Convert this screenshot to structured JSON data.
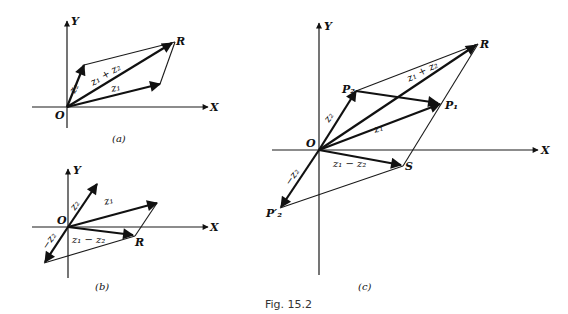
{
  "figure": {
    "caption": "Fig. 15.2",
    "panels": [
      {
        "id": "a",
        "caption": "(a)",
        "axis_labels": {
          "x": "X",
          "y": "Y",
          "origin": "O"
        },
        "points": {
          "R": "R"
        },
        "vectors": {
          "z1": "z₁",
          "z2": "z₂",
          "sum": "z₁ + z₂"
        }
      },
      {
        "id": "b",
        "caption": "(b)",
        "axis_labels": {
          "x": "X",
          "y": "Y",
          "origin": "O"
        },
        "points": {
          "R": "R"
        },
        "vectors": {
          "z1": "z₁",
          "z2": "z₂",
          "neg_z2": "−z₂",
          "diff": "z₁ − z₂"
        }
      },
      {
        "id": "c",
        "caption": "(c)",
        "axis_labels": {
          "x": "X",
          "y": "Y",
          "origin": "O"
        },
        "points": {
          "R": "R",
          "P1": "P₁",
          "P2": "P₂",
          "S": "S",
          "P2prime": "P′₂"
        },
        "vectors": {
          "z1": "z₁",
          "z2": "z₂",
          "neg_z2": "−z₂",
          "sum": "z₁ + z₂",
          "diff": "z₁ − z₂"
        }
      }
    ]
  }
}
